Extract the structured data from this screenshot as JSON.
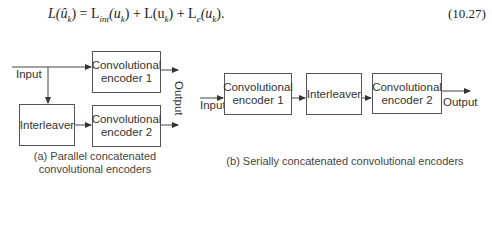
{
  "equation": {
    "lhs": "L(û",
    "lhs_sub": "k",
    "lhs_close": ") = L",
    "t1_sub": "int",
    "t1_arg": "(u",
    "t1_arg_sub": "k",
    "t2": ") + L(u",
    "t2_sub": "k",
    "t3": ") + L",
    "t3_sub": "e",
    "t3_arg": "(u",
    "t3_arg_sub": "k",
    "end": ").",
    "number": "(10.27)"
  },
  "figure_a": {
    "input_label": "Input",
    "encoder1": "Convolutional encoder 1",
    "encoder2": "Convolutional encoder 2",
    "interleaver": "Interleaver",
    "output_label": "Output",
    "caption_line1": "(a) Parallel concatenated",
    "caption_line2": "convolutional encoders"
  },
  "figure_b": {
    "input_label": "Input",
    "encoder1": "Convolutional encoder 1",
    "interleaver": "Interleaver",
    "encoder2": "Convolutional encoder 2",
    "output_label": "Output",
    "caption": "(b) Serially concatenated convolutional encoders"
  }
}
